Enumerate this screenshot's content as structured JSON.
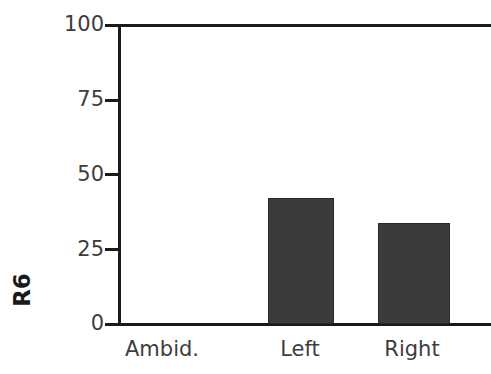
{
  "chart_data": {
    "type": "bar",
    "title": "",
    "xlabel": "",
    "ylabel": "R6",
    "categories": [
      "Ambid.",
      "Left",
      "Right"
    ],
    "values": [
      0,
      42.5,
      34
    ],
    "ylim": [
      0,
      100
    ],
    "yticks": [
      "0",
      "25",
      "50",
      "75",
      "100"
    ],
    "ytick_values": [
      0,
      25,
      50,
      75,
      100
    ],
    "grid": false,
    "legend": null,
    "bar_color": "#3b3b3b",
    "axis_color": "#1a1a1a",
    "background_color": "#ffffff"
  },
  "axis": {
    "y_title": "R6",
    "ticks": [
      {
        "label": "100",
        "value": 100
      },
      {
        "label": "75",
        "value": 75
      },
      {
        "label": "50",
        "value": 50
      },
      {
        "label": "25",
        "value": 25
      },
      {
        "label": "0",
        "value": 0
      }
    ]
  },
  "bars": [
    {
      "label": "Ambid.",
      "value": 0
    },
    {
      "label": "Left",
      "value": 42.5
    },
    {
      "label": "Right",
      "value": 34
    }
  ]
}
